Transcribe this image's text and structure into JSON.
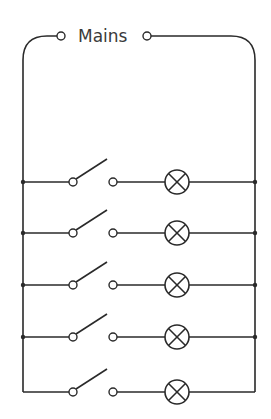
{
  "diagram": {
    "supply_label": "Mains",
    "colors": {
      "wire": "#2a2a2a",
      "background": "#ffffff",
      "text": "#3a3a3a"
    },
    "branches": [
      {
        "index": 1,
        "switch": "open",
        "component": "lamp"
      },
      {
        "index": 2,
        "switch": "open",
        "component": "lamp"
      },
      {
        "index": 3,
        "switch": "open",
        "component": "lamp"
      },
      {
        "index": 4,
        "switch": "open",
        "component": "lamp"
      },
      {
        "index": 5,
        "switch": "open",
        "component": "lamp"
      }
    ]
  }
}
